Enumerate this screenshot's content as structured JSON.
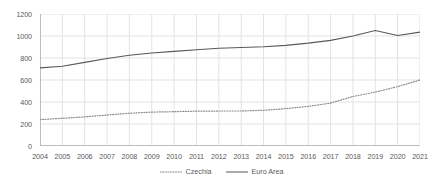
{
  "chart_data": {
    "type": "line",
    "title": "",
    "subtitle": "",
    "xlabel": "",
    "ylabel": "",
    "x": [
      2004,
      2005,
      2006,
      2007,
      2008,
      2009,
      2010,
      2011,
      2012,
      2013,
      2014,
      2015,
      2016,
      2017,
      2018,
      2019,
      2020,
      2021
    ],
    "categories": [
      "2004",
      "2005",
      "2006",
      "2007",
      "2008",
      "2009",
      "2010",
      "2011",
      "2012",
      "2013",
      "2014",
      "2015",
      "2016",
      "2017",
      "2018",
      "2019",
      "2020",
      "2021"
    ],
    "series": [
      {
        "name": "Czechia",
        "style": "dotted",
        "color": "#8c8c8c",
        "values": [
          240,
          252,
          265,
          282,
          298,
          308,
          312,
          317,
          318,
          318,
          325,
          340,
          360,
          390,
          450,
          490,
          540,
          600
        ]
      },
      {
        "name": "Euro Area",
        "style": "solid",
        "color": "#595959",
        "values": [
          710,
          725,
          760,
          795,
          825,
          845,
          860,
          875,
          888,
          896,
          902,
          915,
          935,
          960,
          1000,
          1050,
          1005,
          1035
        ]
      }
    ],
    "ylim": [
      0,
      1200
    ],
    "yticks": [
      0,
      200,
      400,
      600,
      800,
      1000,
      1200
    ],
    "ytick_labels": [
      "0",
      "200",
      "400",
      "600",
      "800",
      "1000",
      "1200"
    ],
    "grid": true,
    "grid_axis": "both",
    "grid_color": "#e3e3e3",
    "legend": [
      "Czechia",
      "Euro Area"
    ],
    "legend_position": "bottom",
    "background": "#ffffff"
  }
}
